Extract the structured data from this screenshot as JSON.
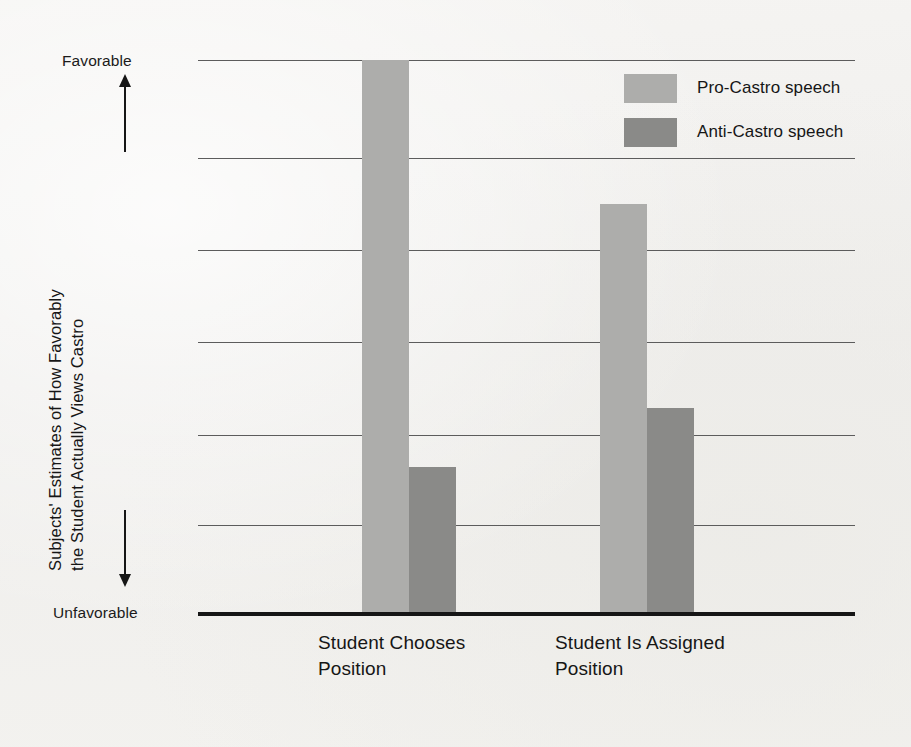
{
  "chart_data": {
    "type": "bar",
    "title": "",
    "subtitle": "",
    "xlabel": "",
    "ylabel_line_1": "Subjects' Estimates of How Favorably",
    "ylabel_line_2": "the Student Actually Views Castro",
    "categories": [
      "Student Chooses\nPosition",
      "Student Is Assigned\nPosition"
    ],
    "series": [
      {
        "name": "Pro-Castro speech",
        "color": "#adadab",
        "values": [
          100,
          74
        ]
      },
      {
        "name": "Anti-Castro speech",
        "color": "#8a8a88",
        "values": [
          26.5,
          37.2
        ]
      }
    ],
    "ylim": [
      0,
      100
    ],
    "y_axis_top_label": "Favorable",
    "y_axis_bottom_label": "Unfavorable",
    "y_tick_values": [
      100,
      82.3,
      65.7,
      49.1,
      32.3,
      16.1
    ],
    "grid": true,
    "grid_orientation": "horizontal",
    "legend_position": "top-right",
    "axis_tick_labels": []
  },
  "legend": {
    "items": [
      {
        "label": "Pro-Castro speech",
        "color": "#adadab"
      },
      {
        "label": "Anti-Castro speech",
        "color": "#8a8a88"
      }
    ]
  },
  "axis": {
    "favorable": "Favorable",
    "unfavorable": "Unfavorable",
    "up_arrow_icon": "arrow-up-icon",
    "down_arrow_icon": "arrow-down-icon"
  },
  "colors": {
    "background": "#f2f2f0",
    "gridline": "#5c5c5c",
    "baseline": "#161616",
    "text": "#161616",
    "pro_castro": "#adadab",
    "anti_castro": "#8a8a88"
  }
}
